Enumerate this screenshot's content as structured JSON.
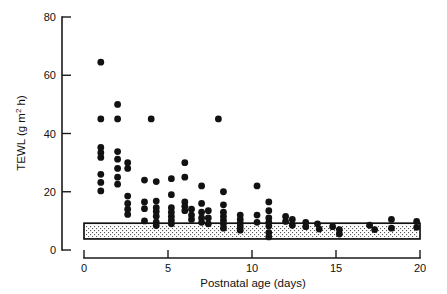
{
  "chart_data": {
    "type": "scatter",
    "title": "",
    "xlabel": "Postnatal age (days)",
    "ylabel": "TEWL (g m",
    "ylabel_sup": "2",
    "ylabel_tail": " h)",
    "ylabel_full": "TEWL (g m2 h)",
    "xlim": [
      0,
      20
    ],
    "ylim": [
      0,
      80
    ],
    "xticks": [
      0,
      5,
      10,
      15,
      20
    ],
    "yticks": [
      0,
      20,
      40,
      60,
      80
    ],
    "xtick_labels": [
      "0",
      "5",
      "10",
      "15",
      "20"
    ],
    "ytick_labels": [
      "0",
      "20",
      "40",
      "60",
      "80"
    ],
    "grid": false,
    "legend": "none",
    "marker": "filled-circle",
    "marker_color": "#121212",
    "marker_radius_px": 3.4,
    "reference_band": {
      "label": "adult reference range (stippled band)",
      "y_low": 3.8,
      "y_high": 9.2,
      "x_start": 0,
      "x_end": 20,
      "fill": "stipple",
      "border_color": "#111111"
    },
    "annotations": [],
    "points": [
      {
        "x": 1.0,
        "y": 64.5
      },
      {
        "x": 1.0,
        "y": 45.0
      },
      {
        "x": 1.0,
        "y": 35.2
      },
      {
        "x": 1.0,
        "y": 33.4
      },
      {
        "x": 1.0,
        "y": 31.8
      },
      {
        "x": 1.0,
        "y": 26.0
      },
      {
        "x": 1.0,
        "y": 23.2
      },
      {
        "x": 1.0,
        "y": 20.3
      },
      {
        "x": 2.0,
        "y": 50.0
      },
      {
        "x": 2.0,
        "y": 45.0
      },
      {
        "x": 2.0,
        "y": 33.8
      },
      {
        "x": 2.0,
        "y": 31.2
      },
      {
        "x": 2.0,
        "y": 28.0
      },
      {
        "x": 2.0,
        "y": 25.0
      },
      {
        "x": 2.0,
        "y": 22.6
      },
      {
        "x": 2.6,
        "y": 30.0
      },
      {
        "x": 2.6,
        "y": 28.0
      },
      {
        "x": 2.6,
        "y": 18.5
      },
      {
        "x": 2.6,
        "y": 16.0
      },
      {
        "x": 2.6,
        "y": 14.0
      },
      {
        "x": 2.6,
        "y": 12.2
      },
      {
        "x": 4.0,
        "y": 45.0
      },
      {
        "x": 3.6,
        "y": 24.0
      },
      {
        "x": 3.6,
        "y": 16.5
      },
      {
        "x": 3.6,
        "y": 14.2
      },
      {
        "x": 3.6,
        "y": 10.0
      },
      {
        "x": 4.3,
        "y": 23.5
      },
      {
        "x": 4.3,
        "y": 16.8
      },
      {
        "x": 4.3,
        "y": 14.5
      },
      {
        "x": 4.3,
        "y": 13.2
      },
      {
        "x": 4.3,
        "y": 11.6
      },
      {
        "x": 4.3,
        "y": 9.6
      },
      {
        "x": 4.3,
        "y": 8.4
      },
      {
        "x": 5.2,
        "y": 24.5
      },
      {
        "x": 5.2,
        "y": 19.0
      },
      {
        "x": 5.2,
        "y": 14.5
      },
      {
        "x": 5.2,
        "y": 13.0
      },
      {
        "x": 5.2,
        "y": 11.5
      },
      {
        "x": 5.2,
        "y": 10.2
      },
      {
        "x": 5.2,
        "y": 9.0
      },
      {
        "x": 6.0,
        "y": 30.0
      },
      {
        "x": 6.0,
        "y": 25.0
      },
      {
        "x": 6.0,
        "y": 16.5
      },
      {
        "x": 6.0,
        "y": 15.0
      },
      {
        "x": 6.0,
        "y": 13.5
      },
      {
        "x": 6.4,
        "y": 14.0
      },
      {
        "x": 6.4,
        "y": 12.0
      },
      {
        "x": 6.4,
        "y": 10.5
      },
      {
        "x": 7.0,
        "y": 22.0
      },
      {
        "x": 7.0,
        "y": 16.0
      },
      {
        "x": 7.0,
        "y": 13.0
      },
      {
        "x": 7.0,
        "y": 11.0
      },
      {
        "x": 7.0,
        "y": 9.5
      },
      {
        "x": 7.4,
        "y": 13.5
      },
      {
        "x": 7.4,
        "y": 11.0
      },
      {
        "x": 7.4,
        "y": 9.0
      },
      {
        "x": 8.0,
        "y": 45.0
      },
      {
        "x": 8.3,
        "y": 20.0
      },
      {
        "x": 8.3,
        "y": 15.5
      },
      {
        "x": 8.3,
        "y": 13.0
      },
      {
        "x": 8.3,
        "y": 11.5
      },
      {
        "x": 8.3,
        "y": 10.2
      },
      {
        "x": 8.3,
        "y": 9.0
      },
      {
        "x": 8.3,
        "y": 7.5
      },
      {
        "x": 9.3,
        "y": 12.0
      },
      {
        "x": 9.3,
        "y": 10.5
      },
      {
        "x": 9.3,
        "y": 9.2
      },
      {
        "x": 9.3,
        "y": 8.0
      },
      {
        "x": 9.3,
        "y": 6.8
      },
      {
        "x": 10.3,
        "y": 22.0
      },
      {
        "x": 10.3,
        "y": 12.0
      },
      {
        "x": 10.3,
        "y": 9.5
      },
      {
        "x": 11.0,
        "y": 16.5
      },
      {
        "x": 11.0,
        "y": 13.5
      },
      {
        "x": 11.0,
        "y": 11.0
      },
      {
        "x": 11.0,
        "y": 9.5
      },
      {
        "x": 11.0,
        "y": 8.2
      },
      {
        "x": 11.0,
        "y": 6.0
      },
      {
        "x": 11.0,
        "y": 4.5
      },
      {
        "x": 12.0,
        "y": 11.5
      },
      {
        "x": 12.0,
        "y": 9.8
      },
      {
        "x": 12.4,
        "y": 10.5
      },
      {
        "x": 12.4,
        "y": 8.5
      },
      {
        "x": 13.2,
        "y": 9.5
      },
      {
        "x": 13.2,
        "y": 8.0
      },
      {
        "x": 13.9,
        "y": 9.0
      },
      {
        "x": 14.0,
        "y": 7.2
      },
      {
        "x": 14.8,
        "y": 8.0
      },
      {
        "x": 15.2,
        "y": 7.0
      },
      {
        "x": 15.2,
        "y": 5.5
      },
      {
        "x": 17.0,
        "y": 8.5
      },
      {
        "x": 17.3,
        "y": 7.0
      },
      {
        "x": 18.3,
        "y": 10.5
      },
      {
        "x": 18.3,
        "y": 7.5
      },
      {
        "x": 19.8,
        "y": 9.8
      },
      {
        "x": 19.8,
        "y": 7.8
      }
    ]
  },
  "figure": {
    "background": "#ffffff",
    "axis_color": "#1a1a1a"
  }
}
